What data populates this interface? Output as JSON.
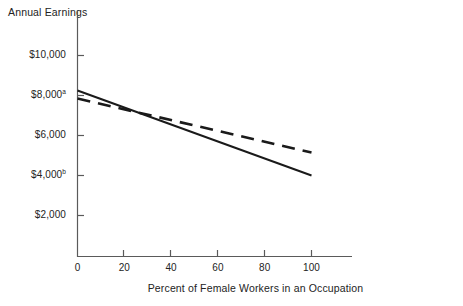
{
  "chart_data": {
    "type": "line",
    "title": "",
    "ylabel": "Annual Earnings",
    "xlabel": "Percent of Female Workers in an Occupation",
    "xlim": [
      0,
      110
    ],
    "ylim": [
      0,
      11000
    ],
    "grid": false,
    "legend": "none",
    "x_ticks": [
      {
        "value": 0,
        "label": "0"
      },
      {
        "value": 20,
        "label": "20"
      },
      {
        "value": 40,
        "label": "40"
      },
      {
        "value": 60,
        "label": "60"
      },
      {
        "value": 80,
        "label": "80"
      },
      {
        "value": 100,
        "label": "100"
      }
    ],
    "y_ticks": [
      {
        "value": 2000,
        "label": "$2,000",
        "note": ""
      },
      {
        "value": 4000,
        "label": "$4,000",
        "note": "b"
      },
      {
        "value": 6000,
        "label": "$6,000",
        "note": ""
      },
      {
        "value": 8000,
        "label": "$8,000",
        "note": "a"
      },
      {
        "value": 10000,
        "label": "$10,000",
        "note": ""
      }
    ],
    "series": [
      {
        "name": "solid-line",
        "style": "solid",
        "color": "#1a1a1a",
        "x": [
          0,
          100
        ],
        "values": [
          8250,
          4000
        ]
      },
      {
        "name": "dashed-line",
        "style": "dashed",
        "color": "#1a1a1a",
        "x": [
          0,
          100
        ],
        "values": [
          7850,
          5150
        ]
      }
    ]
  }
}
